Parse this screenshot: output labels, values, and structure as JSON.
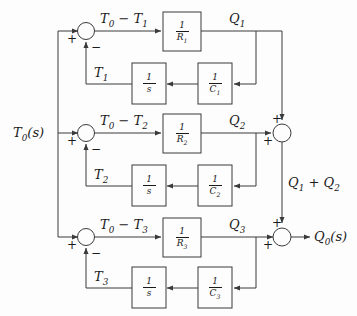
{
  "diagram": {
    "input_label": "T0(s)",
    "output_label": "Q0(s)",
    "mid_sum_label": "Q1 + Q2",
    "line_color": "#3a3a3a",
    "text_color": "#1a1a1a",
    "background": "#fdfdfd"
  },
  "branches": [
    {
      "error_label": "T0 − T1",
      "flow_label": "Q1",
      "feedback_label": "T1",
      "gain_num": "1",
      "gain_den": "R1",
      "integrator_num": "1",
      "integrator_den": "s",
      "capacitance_num": "1",
      "capacitance_den": "C1",
      "sum_plus": "+",
      "sum_minus": "−"
    },
    {
      "error_label": "T0 − T2",
      "flow_label": "Q2",
      "feedback_label": "T2",
      "gain_num": "1",
      "gain_den": "R2",
      "integrator_num": "1",
      "integrator_den": "s",
      "capacitance_num": "1",
      "capacitance_den": "C2",
      "sum_plus": "+",
      "sum_minus": "−"
    },
    {
      "error_label": "T0 − T3",
      "flow_label": "Q3",
      "feedback_label": "T3",
      "gain_num": "1",
      "gain_den": "R3",
      "integrator_num": "1",
      "integrator_den": "s",
      "capacitance_num": "1",
      "capacitance_den": "C3",
      "sum_plus": "+",
      "sum_minus": "−"
    }
  ],
  "adders": {
    "upper": {
      "in_top_sign": "+",
      "in_left_sign": "+"
    },
    "lower": {
      "in_top_sign": "+",
      "in_left_sign": "+"
    }
  }
}
